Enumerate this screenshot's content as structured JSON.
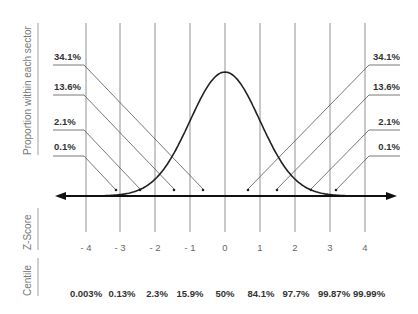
{
  "chart_data": {
    "type": "line",
    "title": "",
    "ylabel": "Proportion within each sector",
    "xlabel": "Z-Score",
    "z_scores": [
      "- 4",
      "- 3",
      "- 2",
      "- 1",
      "0",
      "1",
      "2",
      "3",
      "4"
    ],
    "centile_label": "Centile",
    "centiles": [
      "0.003%",
      "0.13%",
      "2.3%",
      "15.9%",
      "50%",
      "84.1%",
      "97.7%",
      "99.87%",
      "99.99%"
    ],
    "sector_proportions_left": [
      "34.1%",
      "13.6%",
      "2.1%",
      "0.1%"
    ],
    "sector_proportions_right": [
      "34.1%",
      "13.6%",
      "2.1%",
      "0.1%"
    ],
    "curve": "standard normal distribution",
    "x_range": [
      -4,
      4
    ],
    "grid": "vertical lines at each integer z-score"
  },
  "labels": {
    "side_proportion": "Proportion within each sector",
    "side_zscore": "Z-Score",
    "side_centile": "Centile"
  }
}
